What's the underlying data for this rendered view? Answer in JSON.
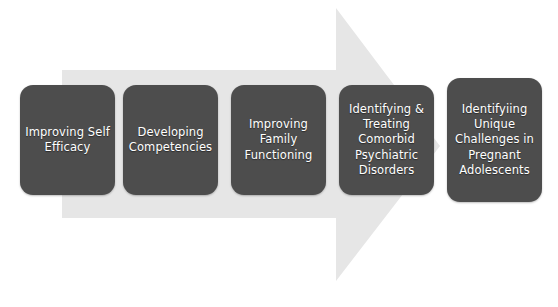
{
  "diagram": {
    "type": "process-arrow",
    "orientation": "horizontal-right",
    "background_color": "#ffffff",
    "arrow": {
      "name": "process-arrow",
      "fill_color": "#e6e6e6",
      "direction": "right"
    },
    "box_fill_color": "#4d4d4d",
    "box_text_color": "#ffffff",
    "stages": [
      {
        "index": 1,
        "label": "Improving Self\nEfficacy",
        "lines": [
          "Improving Self",
          "Efficacy"
        ]
      },
      {
        "index": 2,
        "label": "Developing\nCompetencies",
        "lines": [
          "Developing",
          "Competencies"
        ]
      },
      {
        "index": 3,
        "label": "Improving\nFamily\nFunctioning",
        "lines": [
          "Improving",
          "Family",
          "Functioning"
        ]
      },
      {
        "index": 4,
        "label": "Identifying &\nTreating\nComorbid\nPsychiatric\nDisorders",
        "lines": [
          "Identifying &",
          "Treating",
          "Comorbid",
          "Psychiatric",
          "Disorders"
        ]
      },
      {
        "index": 5,
        "label": "Identifyiing\nUnique\nChallenges in\nPregnant\nAdolescents",
        "lines": [
          "Identifyiing",
          "Unique",
          "Challenges in",
          "Pregnant",
          "Adolescents"
        ]
      }
    ]
  }
}
